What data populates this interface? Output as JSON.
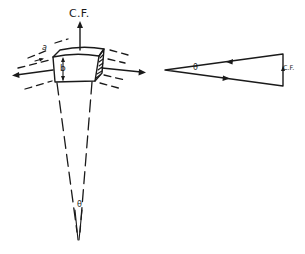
{
  "figure": {
    "left_diagram": {
      "description": "Rim element of rotating body with centrifugal force and tension forces, cone converging to center at angle theta",
      "labels": {
        "centrifugal_force": "C.F.",
        "arc_length": "a",
        "thickness": "b",
        "angle": "θ"
      }
    },
    "right_diagram": {
      "description": "Force triangle (polygon of forces) with two tension vectors and centrifugal force closing side",
      "labels": {
        "angle": "θ",
        "centrifugal_force": "C.F."
      }
    },
    "colors": {
      "ink": "#1a1a1a",
      "background": "#ffffff"
    }
  }
}
